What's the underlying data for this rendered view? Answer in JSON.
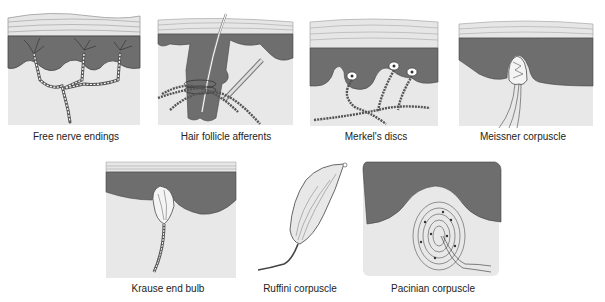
{
  "diagram": {
    "colors": {
      "stratum_corneum": "#e6e6e6",
      "stratum_lines": "#9a9a9a",
      "epidermis": "#6e6e6e",
      "dermis": "#e8e8e8",
      "nerve": "#ffffff",
      "outline": "#333333",
      "label": "#222222"
    },
    "panels": [
      {
        "id": "free-nerve-endings",
        "label": "Free nerve endings"
      },
      {
        "id": "hair-follicle-afferents",
        "label": "Hair follicle afferents"
      },
      {
        "id": "merkels-discs",
        "label": "Merkel's discs"
      },
      {
        "id": "meissner-corpuscle",
        "label": "Meissner corpuscle"
      },
      {
        "id": "krause-end-bulb",
        "label": "Krause end bulb"
      },
      {
        "id": "ruffini-corpuscle",
        "label": "Ruffini corpuscle"
      },
      {
        "id": "pacinian-corpuscle",
        "label": "Pacinian corpuscle"
      }
    ]
  }
}
